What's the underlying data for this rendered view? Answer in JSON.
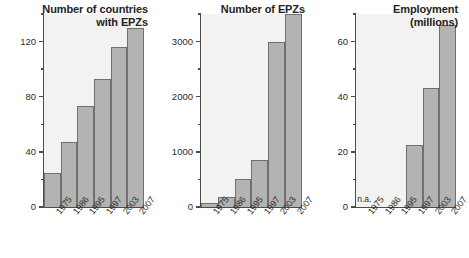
{
  "figure": {
    "name": "export-processing-zones-growth",
    "background": "#ffffff",
    "bar_color": "#b3b3b1",
    "bar_border_color": "#6f6f6f",
    "axis_color": "#4c4c4c",
    "plot_background": "#f2f2f0"
  },
  "chart_data": [
    {
      "type": "bar",
      "title": "Number of countries\nwith EPZs",
      "xlabel": "",
      "ylabel": "",
      "categories": [
        "1975",
        "1986",
        "1995",
        "1997",
        "2003",
        "2007"
      ],
      "values": [
        25,
        47,
        73,
        93,
        116,
        130
      ],
      "ylim": [
        0,
        140
      ],
      "yticks_major": [
        0,
        40,
        80,
        120
      ],
      "yticks_minor": [
        20,
        60,
        100,
        140
      ],
      "ytick_labels": [
        "0",
        "40",
        "80",
        "120"
      ],
      "grid": false,
      "legend": "none"
    },
    {
      "type": "bar",
      "title": "Number of EPZs",
      "xlabel": "",
      "ylabel": "",
      "categories": [
        "1975",
        "1986",
        "1995",
        "1997",
        "2003",
        "2007"
      ],
      "values": [
        79,
        176,
        500,
        845,
        3000,
        3500
      ],
      "ylim": [
        0,
        3500
      ],
      "yticks_major": [
        0,
        1000,
        2000,
        3000
      ],
      "yticks_minor": [
        500,
        1500,
        2500,
        3500
      ],
      "ytick_labels": [
        "0",
        "1000",
        "2000",
        "3000"
      ],
      "grid": false,
      "legend": "none"
    },
    {
      "type": "bar",
      "title": "Employment\n(millions)",
      "xlabel": "",
      "ylabel": "",
      "categories": [
        "1975",
        "1986",
        "1995",
        "1997",
        "2003",
        "2007"
      ],
      "values": [
        null,
        null,
        null,
        22.5,
        43,
        66
      ],
      "missing_label": "n.a.",
      "ylim": [
        0,
        70
      ],
      "yticks_major": [
        0,
        20,
        40,
        60
      ],
      "yticks_minor": [
        10,
        30,
        50,
        70
      ],
      "ytick_labels": [
        "0",
        "20",
        "40",
        "60"
      ],
      "grid": false,
      "legend": "none"
    }
  ]
}
